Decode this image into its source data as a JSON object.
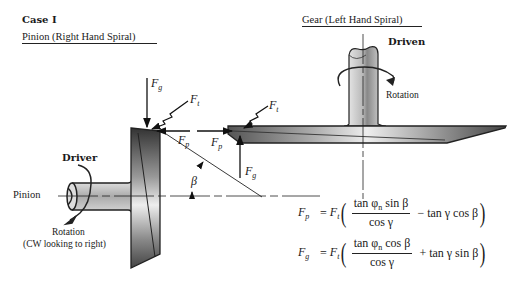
{
  "heading": {
    "case": "Case I",
    "pinion_title": "Pinion (Right Hand Spiral)",
    "gear_title": "Gear (Left Hand Spiral)"
  },
  "gear": {
    "role": "Driven",
    "rotation_label": "Rotation"
  },
  "pinion": {
    "label": "Pinion",
    "role": "Driver",
    "rotation_label": "Rotation",
    "rotation_note": "(CW looking to right)"
  },
  "forces": {
    "Fg": {
      "symbol": "F",
      "sub": "g"
    },
    "Ft": {
      "symbol": "F",
      "sub": "t"
    },
    "Fp": {
      "symbol": "F",
      "sub": "p"
    },
    "angle": "β"
  },
  "equations": [
    {
      "lhs": "F",
      "lhs_sub": "p",
      "ft": "F",
      "ft_sub": "t",
      "num_a": "tan φ",
      "num_sub": "n",
      "num_b": " sin β",
      "den": "cos γ",
      "tail": "− tan γ cos β"
    },
    {
      "lhs": "F",
      "lhs_sub": "g",
      "ft": "F",
      "ft_sub": "t",
      "num_a": "tan φ",
      "num_sub": "n",
      "num_b": " cos β",
      "den": "cos γ",
      "tail": "+ tan γ sin β"
    }
  ]
}
